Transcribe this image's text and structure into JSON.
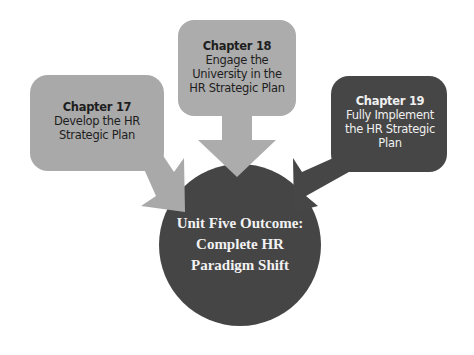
{
  "diagram": {
    "type": "converging-arrows",
    "nodes": [
      {
        "id": "chapter-17",
        "title": "Chapter 17",
        "lines": [
          "Develop the HR",
          "Strategic Plan"
        ],
        "color": "#a9a9a9",
        "text_color": "#1e1e1e"
      },
      {
        "id": "chapter-18",
        "title": "Chapter 18",
        "lines": [
          "Engage the",
          "University in the",
          "HR Strategic Plan"
        ],
        "color": "#acacac",
        "text_color": "#1e1e1e"
      },
      {
        "id": "chapter-19",
        "title": "Chapter 19",
        "lines": [
          "Fully Implement",
          "the HR Strategic",
          "Plan"
        ],
        "color": "#464646",
        "text_color": "#f0f0f0"
      }
    ],
    "outcome": {
      "lines": [
        "Unit Five Outcome:",
        "Complete HR",
        "Paradigm Shift"
      ],
      "color": "#454545",
      "text_color": "#f2f2f2"
    },
    "edges": [
      {
        "from": "chapter-17",
        "to": "outcome"
      },
      {
        "from": "chapter-18",
        "to": "outcome"
      },
      {
        "from": "chapter-19",
        "to": "outcome"
      }
    ]
  }
}
